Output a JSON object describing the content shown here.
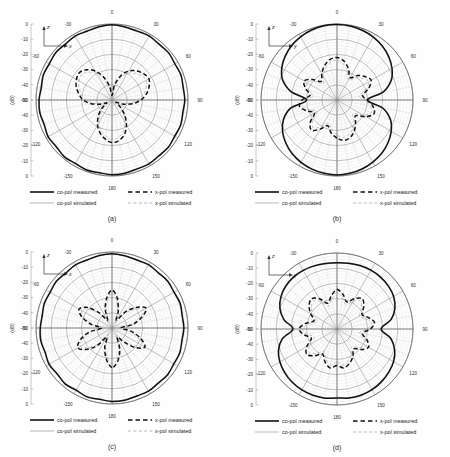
{
  "figure": {
    "background": "#fefefe",
    "panel_count": 4
  },
  "axis_common": {
    "radial_label": "(dB)",
    "radial_ticks_top_to_center": [
      "0",
      "-10",
      "-20",
      "-30",
      "-40",
      "-50"
    ],
    "radial_ticks_center_to_bottom": [
      "-40",
      "-30",
      "-20",
      "-10",
      "0"
    ],
    "angular_ticks": [
      "0",
      "30",
      "60",
      "90",
      "120",
      "150",
      "180",
      "-150",
      "-120",
      "-90",
      "-60",
      "-30"
    ],
    "rmin_db": -50,
    "rmax_db": 0,
    "ring_step_db": 10,
    "spoke_step_deg": 10,
    "major_spoke_step_deg": 30
  },
  "legend": {
    "entries": [
      {
        "label": "co-pol measured",
        "style": "solid",
        "weight": "thick",
        "color": "#111111"
      },
      {
        "label": "x-pol measured",
        "style": "dashed",
        "weight": "thick",
        "color": "#111111"
      },
      {
        "label": "co-pol simulated",
        "style": "solid",
        "weight": "thin",
        "color": "#9a9a9a"
      },
      {
        "label": "x-pol simulated",
        "style": "dashed",
        "weight": "thin",
        "color": "#9a9a9a"
      }
    ]
  },
  "panels": [
    {
      "id": "a",
      "caption": "(a)",
      "axis_vertical": "z",
      "axis_horizontal": "x",
      "pattern_shape": "omnidirectional-rippled"
    },
    {
      "id": "b",
      "caption": "(b)",
      "axis_vertical": "z",
      "axis_horizontal": "y",
      "pattern_shape": "figure-eight"
    },
    {
      "id": "c",
      "caption": "(c)",
      "axis_vertical": "z",
      "axis_horizontal": "x",
      "pattern_shape": "omnidirectional-rippled"
    },
    {
      "id": "d",
      "caption": "(d)",
      "axis_vertical": "z",
      "axis_horizontal": "y",
      "pattern_shape": "figure-eight-broad"
    }
  ],
  "chart_data": [
    {
      "type": "line",
      "subtype": "polar-radiation-pattern",
      "panel": "a",
      "title": "(a)",
      "xlabel": "",
      "ylabel": "(dB)",
      "ylim": [
        -50,
        0
      ],
      "grid": true,
      "legend_position": "bottom",
      "theta_deg": [
        -180,
        -170,
        -160,
        -150,
        -140,
        -130,
        -120,
        -110,
        -100,
        -90,
        -80,
        -70,
        -60,
        -50,
        -40,
        -30,
        -20,
        -10,
        0,
        10,
        20,
        30,
        40,
        50,
        60,
        70,
        80,
        90,
        100,
        110,
        120,
        130,
        140,
        150,
        160,
        170,
        180
      ],
      "series": [
        {
          "name": "co-pol measured",
          "style": "solid",
          "weight": "thick",
          "color": "#111111",
          "values": [
            -0.8,
            -1.4,
            -1.0,
            -1.8,
            -1.2,
            -2.2,
            -1.5,
            -2.6,
            -1.8,
            -2.0,
            -2.8,
            -1.9,
            -2.4,
            -1.6,
            -2.2,
            -1.4,
            -1.9,
            -1.1,
            -0.5,
            -1.2,
            -1.8,
            -1.3,
            -2.0,
            -1.5,
            -2.3,
            -1.7,
            -2.5,
            -2.1,
            -2.7,
            -1.9,
            -2.4,
            -1.6,
            -2.1,
            -1.4,
            -1.8,
            -1.1,
            -0.8
          ]
        },
        {
          "name": "co-pol simulated",
          "style": "solid",
          "weight": "thin",
          "color": "#9a9a9a",
          "values": [
            -1.2,
            -1.5,
            -1.4,
            -1.7,
            -1.6,
            -1.9,
            -1.8,
            -2.1,
            -2.0,
            -2.2,
            -2.2,
            -2.0,
            -1.9,
            -1.7,
            -1.6,
            -1.4,
            -1.3,
            -1.0,
            -0.8,
            -1.0,
            -1.3,
            -1.4,
            -1.6,
            -1.7,
            -1.9,
            -2.0,
            -2.2,
            -2.2,
            -2.1,
            -2.0,
            -1.8,
            -1.7,
            -1.5,
            -1.4,
            -1.3,
            -1.2,
            -1.2
          ]
        },
        {
          "name": "x-pol measured",
          "style": "dashed",
          "weight": "thick",
          "color": "#111111",
          "values": [
            -22,
            -24,
            -27,
            -31,
            -36,
            -41,
            -46,
            -42,
            -36,
            -31,
            -28,
            -25,
            -23,
            -22,
            -24,
            -28,
            -34,
            -41,
            -47,
            -40,
            -33,
            -28,
            -25,
            -23,
            -22,
            -24,
            -27,
            -31,
            -36,
            -42,
            -47,
            -43,
            -37,
            -31,
            -26,
            -23,
            -22
          ]
        },
        {
          "name": "x-pol simulated",
          "style": "dashed",
          "weight": "thin",
          "color": "#9a9a9a",
          "values": [
            -24,
            -26,
            -29,
            -33,
            -38,
            -43,
            -47,
            -43,
            -38,
            -33,
            -30,
            -27,
            -25,
            -24,
            -26,
            -30,
            -35,
            -42,
            -48,
            -41,
            -35,
            -30,
            -27,
            -25,
            -24,
            -26,
            -29,
            -33,
            -38,
            -43,
            -48,
            -44,
            -38,
            -33,
            -28,
            -25,
            -24
          ]
        }
      ]
    },
    {
      "type": "line",
      "subtype": "polar-radiation-pattern",
      "panel": "b",
      "title": "(b)",
      "xlabel": "",
      "ylabel": "(dB)",
      "ylim": [
        -50,
        0
      ],
      "grid": true,
      "legend_position": "bottom",
      "theta_deg": [
        -180,
        -170,
        -160,
        -150,
        -140,
        -130,
        -120,
        -110,
        -100,
        -90,
        -80,
        -70,
        -60,
        -50,
        -40,
        -30,
        -20,
        -10,
        0,
        10,
        20,
        30,
        40,
        50,
        60,
        70,
        80,
        90,
        100,
        110,
        120,
        130,
        140,
        150,
        160,
        170,
        180
      ],
      "series": [
        {
          "name": "co-pol measured",
          "style": "solid",
          "weight": "thick",
          "color": "#111111",
          "values": [
            -0.6,
            -1.0,
            -1.6,
            -2.6,
            -4.0,
            -6.0,
            -8.6,
            -12.5,
            -19.0,
            -30.0,
            -19.5,
            -12.0,
            -8.0,
            -5.4,
            -3.4,
            -2.0,
            -1.0,
            -0.4,
            -0.3,
            -0.5,
            -1.2,
            -2.2,
            -3.6,
            -5.6,
            -8.2,
            -12.0,
            -19.0,
            -30.0,
            -19.5,
            -12.6,
            -8.8,
            -6.2,
            -4.2,
            -2.8,
            -1.7,
            -1.0,
            -0.6
          ]
        },
        {
          "name": "co-pol simulated",
          "style": "solid",
          "weight": "thin",
          "color": "#9a9a9a",
          "values": [
            -0.9,
            -1.3,
            -1.9,
            -2.9,
            -4.3,
            -6.3,
            -9.0,
            -13.0,
            -19.6,
            -31.0,
            -20.0,
            -12.6,
            -8.4,
            -5.8,
            -3.7,
            -2.3,
            -1.3,
            -0.7,
            -0.6,
            -0.8,
            -1.5,
            -2.5,
            -3.9,
            -5.9,
            -8.6,
            -12.5,
            -19.6,
            -31.0,
            -20.0,
            -13.0,
            -9.2,
            -6.5,
            -4.5,
            -3.1,
            -2.0,
            -1.3,
            -0.9
          ]
        },
        {
          "name": "x-pol measured",
          "style": "dashed",
          "weight": "thick",
          "color": "#111111",
          "values": [
            -25,
            -28,
            -32,
            -28,
            -24,
            -27,
            -33,
            -29,
            -25,
            -27,
            -32,
            -28,
            -25,
            -29,
            -34,
            -30,
            -26,
            -23,
            -22,
            -24,
            -28,
            -33,
            -29,
            -26,
            -24,
            -28,
            -33,
            -30,
            -26,
            -24,
            -28,
            -34,
            -31,
            -27,
            -24,
            -23,
            -25
          ]
        },
        {
          "name": "x-pol simulated",
          "style": "dashed",
          "weight": "thin",
          "color": "#9a9a9a",
          "values": [
            -27,
            -30,
            -34,
            -30,
            -26,
            -29,
            -35,
            -31,
            -27,
            -29,
            -34,
            -30,
            -27,
            -31,
            -36,
            -32,
            -28,
            -25,
            -24,
            -26,
            -30,
            -35,
            -31,
            -28,
            -26,
            -30,
            -35,
            -32,
            -28,
            -26,
            -30,
            -36,
            -33,
            -29,
            -26,
            -25,
            -27
          ]
        }
      ]
    },
    {
      "type": "line",
      "subtype": "polar-radiation-pattern",
      "panel": "c",
      "title": "(c)",
      "xlabel": "",
      "ylabel": "(dB)",
      "ylim": [
        -50,
        0
      ],
      "grid": true,
      "legend_position": "bottom",
      "theta_deg": [
        -180,
        -170,
        -160,
        -150,
        -140,
        -130,
        -120,
        -110,
        -100,
        -90,
        -80,
        -70,
        -60,
        -50,
        -40,
        -30,
        -20,
        -10,
        0,
        10,
        20,
        30,
        40,
        50,
        60,
        70,
        80,
        90,
        100,
        110,
        120,
        130,
        140,
        150,
        160,
        170,
        180
      ],
      "series": [
        {
          "name": "co-pol measured",
          "style": "solid",
          "weight": "thick",
          "color": "#111111",
          "values": [
            -1.6,
            -2.4,
            -1.8,
            -2.8,
            -2.0,
            -3.0,
            -2.2,
            -3.2,
            -2.4,
            -2.8,
            -3.4,
            -2.6,
            -3.0,
            -2.2,
            -2.8,
            -2.0,
            -2.4,
            -1.6,
            -1.2,
            -1.8,
            -2.4,
            -1.9,
            -2.6,
            -2.1,
            -2.9,
            -2.3,
            -3.1,
            -2.7,
            -3.3,
            -2.5,
            -3.0,
            -2.2,
            -2.7,
            -2.0,
            -2.4,
            -1.8,
            -1.6
          ]
        },
        {
          "name": "co-pol simulated",
          "style": "solid",
          "weight": "thin",
          "color": "#9a9a9a",
          "values": [
            -2.0,
            -2.3,
            -2.2,
            -2.6,
            -2.5,
            -2.8,
            -2.7,
            -3.0,
            -2.9,
            -3.1,
            -3.1,
            -2.9,
            -2.8,
            -2.6,
            -2.4,
            -2.2,
            -2.0,
            -1.7,
            -1.5,
            -1.8,
            -2.0,
            -2.2,
            -2.4,
            -2.6,
            -2.8,
            -2.9,
            -3.1,
            -3.1,
            -3.0,
            -2.9,
            -2.7,
            -2.6,
            -2.4,
            -2.3,
            -2.2,
            -2.0,
            -2.0
          ]
        },
        {
          "name": "x-pol measured",
          "style": "dashed",
          "weight": "thick",
          "color": "#111111",
          "values": [
            -24,
            -29,
            -36,
            -43,
            -35,
            -28,
            -24,
            -28,
            -35,
            -43,
            -36,
            -29,
            -25,
            -29,
            -37,
            -44,
            -37,
            -30,
            -25,
            -30,
            -38,
            -44,
            -36,
            -29,
            -24,
            -29,
            -36,
            -44,
            -37,
            -30,
            -25,
            -30,
            -38,
            -43,
            -35,
            -28,
            -24
          ]
        },
        {
          "name": "x-pol simulated",
          "style": "dashed",
          "weight": "thin",
          "color": "#9a9a9a",
          "values": [
            -26,
            -31,
            -38,
            -45,
            -37,
            -30,
            -26,
            -30,
            -37,
            -45,
            -38,
            -31,
            -27,
            -31,
            -39,
            -46,
            -39,
            -32,
            -27,
            -32,
            -40,
            -46,
            -38,
            -31,
            -26,
            -31,
            -38,
            -46,
            -39,
            -32,
            -27,
            -32,
            -40,
            -45,
            -37,
            -30,
            -26
          ]
        }
      ]
    },
    {
      "type": "line",
      "subtype": "polar-radiation-pattern",
      "panel": "d",
      "title": "(d)",
      "xlabel": "",
      "ylabel": "(dB)",
      "ylim": [
        -50,
        0
      ],
      "grid": true,
      "legend_position": "bottom",
      "theta_deg": [
        -180,
        -170,
        -160,
        -150,
        -140,
        -130,
        -120,
        -110,
        -100,
        -90,
        -80,
        -70,
        -60,
        -50,
        -40,
        -30,
        -20,
        -10,
        0,
        10,
        20,
        30,
        40,
        50,
        60,
        70,
        80,
        90,
        100,
        110,
        120,
        130,
        140,
        150,
        160,
        170,
        180
      ],
      "series": [
        {
          "name": "co-pol measured",
          "style": "solid",
          "weight": "thick",
          "color": "#111111",
          "values": [
            -4.6,
            -3.8,
            -3.6,
            -3.7,
            -4.2,
            -5.2,
            -6.6,
            -9.0,
            -13.5,
            -21.0,
            -14.5,
            -10.0,
            -7.4,
            -6.0,
            -5.4,
            -5.4,
            -5.8,
            -6.2,
            -6.4,
            -6.0,
            -5.6,
            -5.3,
            -5.4,
            -5.9,
            -7.0,
            -9.4,
            -13.8,
            -21.0,
            -14.0,
            -9.6,
            -7.0,
            -5.6,
            -4.6,
            -3.9,
            -3.6,
            -3.9,
            -4.6
          ]
        },
        {
          "name": "co-pol simulated",
          "style": "solid",
          "weight": "thin",
          "color": "#9a9a9a",
          "values": [
            -5.0,
            -4.2,
            -4.0,
            -4.1,
            -4.6,
            -5.6,
            -7.0,
            -9.4,
            -14.0,
            -22.0,
            -15.0,
            -10.5,
            -7.8,
            -6.4,
            -5.8,
            -5.8,
            -6.2,
            -6.6,
            -6.8,
            -6.4,
            -6.0,
            -5.7,
            -5.8,
            -6.3,
            -7.4,
            -9.8,
            -14.2,
            -22.0,
            -14.4,
            -10.0,
            -7.4,
            -6.0,
            -5.0,
            -4.3,
            -4.0,
            -4.3,
            -5.0
          ]
        },
        {
          "name": "x-pol measured",
          "style": "dashed",
          "weight": "thick",
          "color": "#111111",
          "values": [
            -26,
            -24,
            -27,
            -31,
            -27,
            -24,
            -27,
            -32,
            -28,
            -25,
            -29,
            -34,
            -30,
            -26,
            -24,
            -27,
            -32,
            -28,
            -24,
            -27,
            -31,
            -27,
            -24,
            -27,
            -31,
            -28,
            -25,
            -28,
            -33,
            -29,
            -26,
            -29,
            -33,
            -29,
            -26,
            -24,
            -26
          ]
        },
        {
          "name": "x-pol simulated",
          "style": "dashed",
          "weight": "thin",
          "color": "#9a9a9a",
          "values": [
            -28,
            -26,
            -29,
            -33,
            -29,
            -26,
            -29,
            -34,
            -30,
            -27,
            -31,
            -36,
            -32,
            -28,
            -26,
            -29,
            -34,
            -30,
            -26,
            -29,
            -33,
            -29,
            -26,
            -29,
            -33,
            -30,
            -27,
            -30,
            -35,
            -31,
            -28,
            -31,
            -35,
            -31,
            -28,
            -26,
            -28
          ]
        }
      ]
    }
  ]
}
